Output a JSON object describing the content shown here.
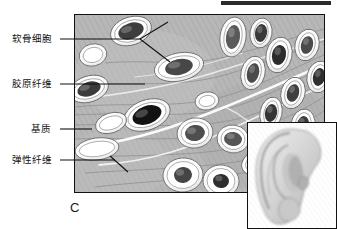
{
  "figure": {
    "panel_letter": "C",
    "tissue_type": "elastic-cartilage",
    "background_color": "#ffffff",
    "matrix_color": "#b9b9b9",
    "lacuna_color": "#ffffff",
    "nucleus_color": "#3a3a3a",
    "border_color": "#111111",
    "top_rule_color": "#2b2b2b",
    "elastic_fiber_color": "#ffffff",
    "collagen_fiber_color": "#8f8f8f"
  },
  "labels": [
    {
      "id": "chondrocyte",
      "text": "软骨细胞",
      "x": 12,
      "y": 33
    },
    {
      "id": "collagen-fiber",
      "text": "胶原纤维",
      "x": 12,
      "y": 78
    },
    {
      "id": "matrix",
      "text": "基质",
      "x": 31,
      "y": 123
    },
    {
      "id": "elastic-fiber",
      "text": "弹性纤维",
      "x": 12,
      "y": 154
    }
  ],
  "leader_lines": [
    {
      "id": "chondrocyte-leader",
      "points": "60,39 140,39 168,22"
    },
    {
      "id": "chondrocyte-leader-branch",
      "points": "140,39 170,62"
    },
    {
      "id": "collagen-fiber-leader",
      "points": "60,84 145,84"
    },
    {
      "id": "matrix-leader",
      "points": "60,129 92,129"
    },
    {
      "id": "elastic-fiber-leader",
      "points": "60,160 115,160"
    },
    {
      "id": "elastic-fiber-leader-branch",
      "points": "110,156 128,172"
    }
  ],
  "inset": {
    "id": "ear-inset",
    "subject": "human-ear",
    "x": 247,
    "y": 122,
    "width": 90,
    "height": 107
  },
  "main_panel": {
    "x": 74,
    "y": 14,
    "width": 251,
    "height": 179
  },
  "top_rule": {
    "x": 221,
    "y": 1,
    "width": 110,
    "height": 4
  },
  "cells": [
    {
      "cx": 56,
      "cy": 16,
      "rx": 21,
      "ry": 14,
      "rot": -18,
      "nrx": 13,
      "nry": 8,
      "tone": "#3d3d3d"
    },
    {
      "cx": 104,
      "cy": 52,
      "rx": 25,
      "ry": 14,
      "rot": -12,
      "nrx": 14,
      "nry": 8,
      "tone": "#474747"
    },
    {
      "cx": 14,
      "cy": 74,
      "rx": 20,
      "ry": 13,
      "rot": -18,
      "nrx": 12,
      "nry": 7,
      "tone": "#3a3a3a"
    },
    {
      "cx": 72,
      "cy": 100,
      "rx": 24,
      "ry": 15,
      "rot": -20,
      "nrx": 15,
      "nry": 9,
      "tone": "#121212"
    },
    {
      "cx": 120,
      "cy": 118,
      "rx": 18,
      "ry": 15,
      "rot": -10,
      "nrx": 10,
      "nry": 8,
      "tone": "#4e4e4e"
    },
    {
      "cx": 158,
      "cy": 124,
      "rx": 16,
      "ry": 14,
      "rot": 8,
      "nrx": 9,
      "nry": 7,
      "tone": "#565656"
    },
    {
      "cx": 22,
      "cy": 134,
      "rx": 22,
      "ry": 11,
      "rot": -8,
      "nrx": 0,
      "nry": 0,
      "tone": "#ffffff"
    },
    {
      "cx": 36,
      "cy": 108,
      "rx": 16,
      "ry": 10,
      "rot": -18,
      "nrx": 0,
      "nry": 0,
      "tone": "#ffffff"
    },
    {
      "cx": 108,
      "cy": 160,
      "rx": 20,
      "ry": 17,
      "rot": -5,
      "nrx": 9,
      "nry": 8,
      "tone": "#454545"
    },
    {
      "cx": 146,
      "cy": 166,
      "rx": 18,
      "ry": 16,
      "rot": 5,
      "nrx": 8,
      "nry": 7,
      "tone": "#2e2e2e"
    },
    {
      "cx": 180,
      "cy": 148,
      "rx": 14,
      "ry": 11,
      "rot": -30,
      "nrx": 8,
      "nry": 6,
      "tone": "#3a3a3a"
    },
    {
      "cx": 158,
      "cy": 22,
      "rx": 13,
      "ry": 20,
      "rot": 8,
      "nrx": 7,
      "nry": 12,
      "tone": "#5a5a5a"
    },
    {
      "cx": 186,
      "cy": 18,
      "rx": 11,
      "ry": 15,
      "rot": 10,
      "nrx": 6,
      "nry": 9,
      "tone": "#3a3a3a"
    },
    {
      "cx": 178,
      "cy": 58,
      "rx": 12,
      "ry": 17,
      "rot": 14,
      "nrx": 6,
      "nry": 10,
      "tone": "#4a4a4a"
    },
    {
      "cx": 204,
      "cy": 40,
      "rx": 13,
      "ry": 18,
      "rot": 12,
      "nrx": 7,
      "nry": 10,
      "tone": "#2c2c2c"
    },
    {
      "cx": 218,
      "cy": 78,
      "rx": 12,
      "ry": 16,
      "rot": 16,
      "nrx": 6,
      "nry": 9,
      "tone": "#3f3f3f"
    },
    {
      "cx": 196,
      "cy": 98,
      "rx": 11,
      "ry": 16,
      "rot": 12,
      "nrx": 6,
      "nry": 9,
      "tone": "#353535"
    },
    {
      "cx": 232,
      "cy": 30,
      "rx": 12,
      "ry": 16,
      "rot": 14,
      "nrx": 6,
      "nry": 9,
      "tone": "#4a4a4a"
    },
    {
      "cx": 244,
      "cy": 62,
      "rx": 12,
      "ry": 16,
      "rot": 12,
      "nrx": 6,
      "nry": 9,
      "tone": "#2f2f2f"
    },
    {
      "cx": 228,
      "cy": 110,
      "rx": 12,
      "ry": 16,
      "rot": 10,
      "nrx": 6,
      "nry": 9,
      "tone": "#3a3a3a"
    },
    {
      "cx": 210,
      "cy": 144,
      "rx": 12,
      "ry": 15,
      "rot": 8,
      "nrx": 6,
      "nry": 9,
      "tone": "#1c1c1c"
    },
    {
      "cx": 132,
      "cy": 86,
      "rx": 12,
      "ry": 9,
      "rot": -10,
      "nrx": 0,
      "nry": 0,
      "tone": "#ffffff"
    },
    {
      "cx": 18,
      "cy": 40,
      "rx": 14,
      "ry": 11,
      "rot": -14,
      "nrx": 0,
      "nry": 0,
      "tone": "#ffffff"
    }
  ]
}
